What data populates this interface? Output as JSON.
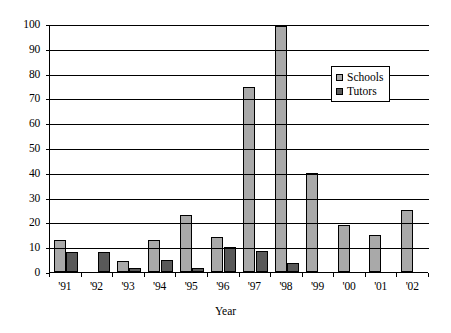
{
  "chart_data": {
    "type": "bar",
    "title": "",
    "subtitle": "",
    "xlabel": "Year",
    "ylabel": "",
    "categories": [
      "'91",
      "'92",
      "'93",
      "'94",
      "'95",
      "'96",
      "'97",
      "'98",
      "'99",
      "'00",
      "'01",
      "'02"
    ],
    "series": [
      {
        "name": "Schools",
        "color": "#a9a9a9",
        "values": [
          13,
          0,
          4.5,
          13,
          23,
          14,
          74.5,
          99,
          40,
          19,
          15,
          25
        ]
      },
      {
        "name": "Tutors",
        "color": "#595959",
        "values": [
          8,
          8,
          1.5,
          5,
          1.5,
          10,
          8.5,
          3.5,
          0,
          0,
          0,
          0
        ]
      }
    ],
    "ylim": [
      0,
      100
    ],
    "yticks": [
      0,
      10,
      20,
      30,
      40,
      50,
      60,
      70,
      80,
      90,
      100
    ],
    "ytick_labels": [
      "0",
      "10",
      "20",
      "30",
      "40",
      "50",
      "60",
      "70",
      "80",
      "90",
      "100"
    ],
    "grid": true,
    "grid_axis": "y",
    "legend_position": "upper right (inside plot)",
    "legend_entries": [
      "Schools",
      "Tutors"
    ],
    "annotations": []
  }
}
